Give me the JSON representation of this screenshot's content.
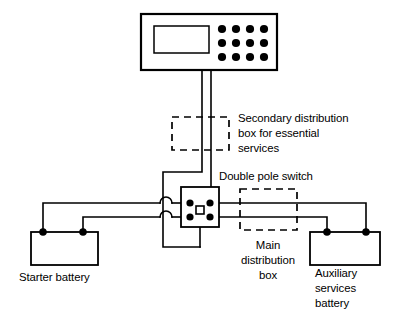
{
  "diagram": {
    "background_color": "#ffffff",
    "line_color": "#000000"
  },
  "labels": {
    "secondary_box": {
      "name": "secondary-distribution-box-label",
      "lines": [
        "Secondary distribution",
        "box for essential",
        "services"
      ],
      "line1": "Secondary distribution",
      "line2": "box for essential",
      "line3": "services"
    },
    "double_pole_switch": {
      "name": "double-pole-switch-label",
      "line1": "Double pole switch"
    },
    "main_box": {
      "name": "main-distribution-box-label",
      "lines": [
        "Main",
        "distribution",
        "box"
      ],
      "line1": "Main",
      "line2": "distribution",
      "line3": "box"
    },
    "starter_battery": {
      "name": "starter-battery-label",
      "line1": "Starter battery"
    },
    "auxiliary_battery": {
      "name": "auxiliary-services-battery-label",
      "lines": [
        "Auxiliary",
        "services",
        "battery"
      ],
      "line1": "Auxiliary",
      "line2": "services",
      "line3": "battery"
    }
  },
  "components": {
    "control_panel": {
      "name": "control-panel",
      "display": "display-screen",
      "button_rows": 3,
      "button_cols": 4,
      "button_count": 12
    },
    "secondary_distribution_box": {
      "name": "secondary-distribution-box",
      "style": "dashed"
    },
    "main_distribution_box": {
      "name": "main-distribution-box",
      "style": "dashed"
    },
    "double_pole_switch": {
      "name": "double-pole-switch",
      "terminal_count": 4,
      "actuator": "switch-actuator"
    },
    "starter_battery": {
      "name": "starter-battery",
      "terminal_count": 2
    },
    "auxiliary_services_battery": {
      "name": "auxiliary-services-battery",
      "terminal_count": 2
    },
    "wire_crossings": {
      "name": "wire-crossover-hops",
      "count": 2
    }
  }
}
